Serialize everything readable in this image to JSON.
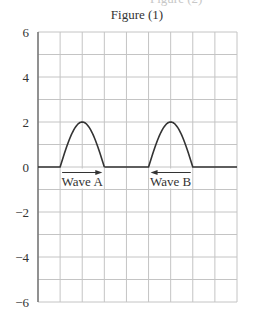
{
  "header": {
    "top_remnant": "Figure (2)",
    "figure_title": "Figure (1)"
  },
  "colors": {
    "grid": "#c4c4c4",
    "axis": "#666666",
    "curve": "#333333",
    "text": "#333333"
  },
  "chart_data": {
    "type": "line",
    "title": "Figure (1)",
    "xlabel": "",
    "ylabel": "",
    "xlim": [
      0,
      9
    ],
    "ylim": [
      -6,
      6
    ],
    "grid": true,
    "x_grid_step": 1,
    "y_grid_step": 1,
    "y_ticks": [
      6,
      4,
      2,
      0,
      -2,
      -4,
      -6
    ],
    "y_tick_labels": [
      "6",
      "4",
      "2",
      "0",
      "−2",
      "−4",
      "−6"
    ],
    "x_ticks": [],
    "series": [
      {
        "name": "Wave A",
        "shape": "half-sine pulse",
        "start_x": 1,
        "peak_x": 2,
        "end_x": 3,
        "amplitude": 2,
        "direction": "right",
        "points": [
          [
            0,
            0
          ],
          [
            1,
            0
          ],
          [
            1.5,
            1.41
          ],
          [
            2,
            2
          ],
          [
            2.5,
            1.41
          ],
          [
            3,
            0
          ]
        ]
      },
      {
        "name": "Wave B",
        "shape": "half-sine pulse",
        "start_x": 5,
        "peak_x": 6,
        "end_x": 7,
        "amplitude": 2,
        "direction": "left",
        "points": [
          [
            3,
            0
          ],
          [
            5,
            0
          ],
          [
            5.5,
            1.41
          ],
          [
            6,
            2
          ],
          [
            6.5,
            1.41
          ],
          [
            7,
            0
          ],
          [
            9,
            0
          ]
        ]
      }
    ],
    "annotations": [
      {
        "text": "Wave A",
        "arrow": "right",
        "x_from": 1,
        "x_to": 3
      },
      {
        "text": "Wave B",
        "arrow": "left",
        "x_from": 7,
        "x_to": 5
      }
    ]
  }
}
